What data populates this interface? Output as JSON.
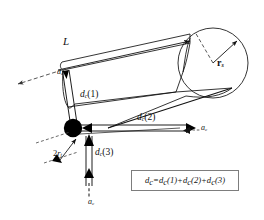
{
  "figure": {
    "type": "engineering-vector-diagram",
    "background_color": "#ffffff",
    "line_color": "#111111",
    "node_color": "#000000",
    "dash_color": "#555555",
    "box_border_color": "#7d7d7d"
  },
  "labels": {
    "length": "L",
    "sphere_radius_base": "r",
    "sphere_radius_sub": "s",
    "tube_diameter_prefix": "2",
    "tube_radius_base": "r",
    "tube_radius_sub": "t",
    "accel_base": "a",
    "accel_sub": "c",
    "d1_base": "d",
    "d1_sub": "c",
    "d1_arg": "(1)",
    "d2_base": "d",
    "d2_sub": "c",
    "d2_arg": "(2)",
    "d3_base": "d",
    "d3_sub": "c",
    "d3_arg": "(3)"
  },
  "equation": {
    "lhs_base": "d",
    "lhs_sub": "c",
    "eq": "=",
    "term1": "d",
    "term1_sub": "c",
    "term1_arg": "(1)",
    "plus1": "+",
    "term2": "d",
    "term2_sub": "c",
    "term2_arg": "(2)",
    "plus2": "+",
    "term3": "d",
    "term3_sub": "c",
    "term3_arg": "(3)",
    "full_text": "dc=dc(1)+dc(2)+dc(3)"
  },
  "vectors": [
    {
      "name": "d_c(1)",
      "direction": "up-right",
      "from": "node",
      "style": "double-line-arrow"
    },
    {
      "name": "d_c(2)",
      "direction": "right",
      "from": "node",
      "style": "double-line-arrow"
    },
    {
      "name": "d_c(3)",
      "direction": "down",
      "from": "node",
      "style": "double-line-arrow"
    },
    {
      "name": "a_c-top-left",
      "direction": "down-left",
      "style": "dashed-arrow"
    },
    {
      "name": "a_c-right",
      "direction": "right",
      "style": "dashed-arrow"
    },
    {
      "name": "a_c-bottom",
      "direction": "down",
      "style": "dashed-arrow"
    },
    {
      "name": "L-dimension",
      "direction": "up-right",
      "style": "solid-arrow"
    },
    {
      "name": "r_s-radius",
      "direction": "up-right",
      "style": "solid-arrow"
    },
    {
      "name": "2r_t-dimension",
      "direction": "both",
      "style": "dimension-arrows"
    }
  ]
}
